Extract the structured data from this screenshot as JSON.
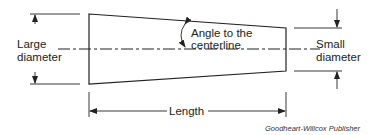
{
  "diagram": {
    "labels": {
      "large_diameter_line1": "Large",
      "large_diameter_line2": "diameter",
      "angle_line1": "Angle to the",
      "angle_line2": "centerline",
      "small_diameter_line1": "Small",
      "small_diameter_line2": "diameter",
      "length": "Length"
    },
    "credit": "Goodheart-Willcox Publisher",
    "colors": {
      "stroke": "#222222",
      "text": "#222222"
    }
  }
}
